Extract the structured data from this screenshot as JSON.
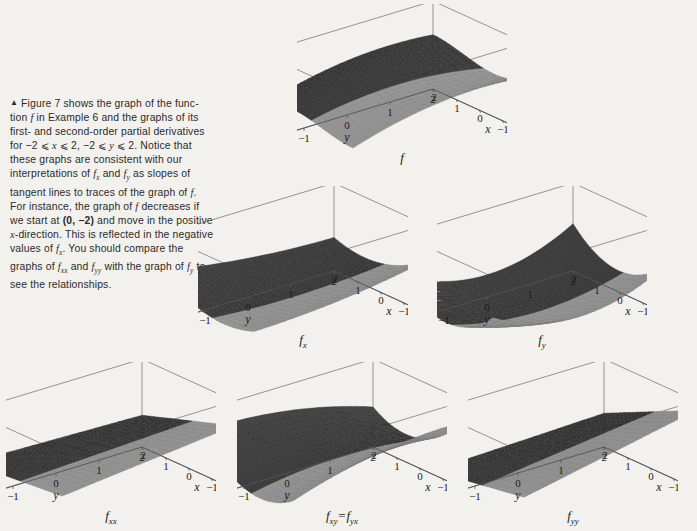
{
  "figure": {
    "bullet": "▲",
    "caption_lines": [
      "Figure 7 shows the graph of the func-",
      "tion f in Example 6 and the graphs of its",
      "first- and second-order partial derivatives",
      "for −2 ⩽ x ⩽ 2, −2 ⩽ y ⩽ 2. Notice",
      "that these graphs are consistent with our",
      "interpretations of fx and fy as slopes of",
      "tangent lines to traces of the graph of f.",
      "For instance, the graph of f decreases",
      "if we start at (0, −2) and move in the",
      "positive x-direction. This is reflected in",
      "the negative values of fx. You should",
      "compare the graphs of fxx and fyy with",
      "the graph of fy to see the relationships."
    ],
    "caption_text": "▲ Figure 7 shows the graph of the function f in Example 6 and the graphs of its first- and second-order partial derivatives for −2 ⩽ x ⩽ 2, −2 ⩽ y ⩽ 2. Notice that these graphs are consistent with our interpretations of fx and fy as slopes of tangent lines to traces of the graph of f. For instance, the graph of f decreases if we start at (0, −2) and move in the positive x-direction. This is reflected in the negative values of fx. You should compare the graphs of fxx and fyy with the graph of fy to see the relationships.",
    "figure_number": "7",
    "example_number": "6"
  },
  "chart_data": [
    {
      "id": "f",
      "type": "surface",
      "title": "f",
      "label_base": "f",
      "label_sub": "",
      "function": "x^3 + x^2*y - 2*y^2 - 4*x  (surface of Example 6)",
      "xlabel": "x",
      "ylabel": "y",
      "zlabel": "z",
      "xlim": [
        -2,
        2
      ],
      "ylim": [
        -2,
        2
      ],
      "zlim": [
        -45,
        28
      ],
      "x_ticks": [
        2,
        1,
        0,
        -1,
        -2
      ],
      "y_ticks": [
        -2,
        -1,
        0,
        1,
        2
      ],
      "z_ticks": [
        20,
        0,
        -20,
        -40
      ],
      "grid": false,
      "legend": "none"
    },
    {
      "id": "fx",
      "type": "surface",
      "title": "f_x",
      "label_base": "f",
      "label_sub": "x",
      "function": "partial derivative of f with respect to x",
      "xlabel": "x",
      "ylabel": "y",
      "zlabel": "z",
      "xlim": [
        -2,
        2
      ],
      "ylim": [
        -2,
        2
      ],
      "zlim": [
        -25,
        50
      ],
      "x_ticks": [
        2,
        1,
        0,
        -1,
        -2
      ],
      "y_ticks": [
        -2,
        -1,
        0,
        1,
        2
      ],
      "z_ticks": [
        40,
        20,
        0,
        -20
      ],
      "grid": false,
      "legend": "none"
    },
    {
      "id": "fy",
      "type": "surface",
      "title": "f_y",
      "label_base": "f",
      "label_sub": "y",
      "function": "partial derivative of f with respect to y",
      "xlabel": "x",
      "ylabel": "y",
      "zlabel": "z",
      "xlim": [
        -2,
        2
      ],
      "ylim": [
        -2,
        2
      ],
      "zlim": [
        -10,
        55
      ],
      "x_ticks": [
        2,
        1,
        0,
        -1,
        -2
      ],
      "y_ticks": [
        -2,
        -1,
        0,
        1,
        2
      ],
      "z_ticks": [
        40,
        20,
        0
      ],
      "grid": false,
      "legend": "none"
    },
    {
      "id": "fxx",
      "type": "surface",
      "title": "f_xx",
      "label_base": "f",
      "label_sub": "xx",
      "function": "second partial derivative of f with respect to x twice",
      "xlabel": "x",
      "ylabel": "y",
      "zlabel": "z",
      "xlim": [
        -2,
        2
      ],
      "ylim": [
        -2,
        2
      ],
      "zlim": [
        -28,
        28
      ],
      "x_ticks": [
        2,
        1,
        0,
        -1,
        -2
      ],
      "y_ticks": [
        -2,
        -1,
        0,
        1,
        2
      ],
      "z_ticks": [
        20,
        0,
        -20
      ],
      "grid": false,
      "legend": "none"
    },
    {
      "id": "fxy",
      "type": "surface",
      "title": "f_xy = f_yx",
      "label_base": "f",
      "label_sub": "xy",
      "label_base2": "f",
      "label_sub2": "yx",
      "label_eq": "=",
      "function": "mixed second partial derivative of f",
      "xlabel": "x",
      "ylabel": "y",
      "zlabel": "z",
      "xlim": [
        -2,
        2
      ],
      "ylim": [
        -2,
        2
      ],
      "zlim": [
        -50,
        52
      ],
      "x_ticks": [
        2,
        1,
        0,
        -1,
        -2
      ],
      "y_ticks": [
        -2,
        -1,
        0,
        1,
        2
      ],
      "z_ticks": [
        40,
        20,
        0,
        -20,
        -40
      ],
      "grid": false,
      "legend": "none"
    },
    {
      "id": "fyy",
      "type": "surface",
      "title": "f_yy",
      "label_base": "f",
      "label_sub": "yy",
      "function": "second partial derivative of f with respect to y twice",
      "xlabel": "x",
      "ylabel": "y",
      "zlabel": "z",
      "xlim": [
        -2,
        2
      ],
      "ylim": [
        -2,
        2
      ],
      "zlim": [
        -55,
        50
      ],
      "x_ticks": [
        2,
        1,
        0,
        -1,
        -2
      ],
      "y_ticks": [
        -2,
        -1,
        0,
        1,
        2
      ],
      "z_ticks": [
        40,
        20,
        0,
        -20,
        -40
      ],
      "grid": false,
      "legend": "none"
    }
  ],
  "colors": {
    "page_background": "#f3f1ee",
    "ink": "#1a1a1a",
    "axis": "#555555",
    "box": "#6b6b6b",
    "mesh_dark": "#2b2b2b",
    "mesh_light": "#9a9a9a"
  }
}
